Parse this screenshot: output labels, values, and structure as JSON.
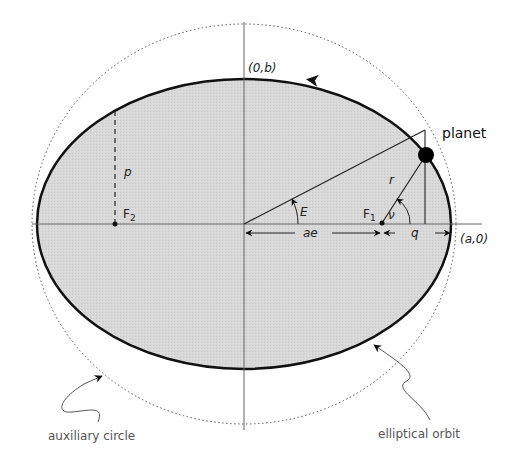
{
  "labels": {
    "top_vertex": "(0,b)",
    "right_vertex": "(a,0)",
    "planet": "planet",
    "semi_latus_rectum": "p",
    "focus_2": "F",
    "focus_2_sub": "2",
    "focus_1": "F",
    "focus_1_sub": "1",
    "eccentric_anomaly": "E",
    "true_anomaly": "ν",
    "radius_vector": "r",
    "focal_offset": "ae",
    "perihelion_distance": "q",
    "auxiliary_circle": "auxiliary circle",
    "elliptical_orbit": "elliptical orbit"
  },
  "colors": {
    "ellipse_fill": "#d6d6d6",
    "ellipse_stroke": "#111111",
    "axis_stroke": "#666666",
    "circle_stroke": "#555555",
    "caption_text": "#555555"
  }
}
